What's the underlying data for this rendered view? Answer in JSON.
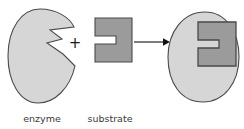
{
  "figure": {
    "background_color": "#ffffff"
  },
  "colors": {
    "enzyme_fill": "#d6d6d6",
    "enzyme_stroke": "#4a4a4a",
    "substrate_fill": "#9b9b9b",
    "substrate_stroke": "#4a4a4a",
    "arrow_color": "#111111",
    "plus_color": "#1a1a1a",
    "label_color": "#3a3a3a"
  },
  "labels": {
    "enzyme": "enzyme",
    "substrate": "substrate"
  },
  "operators": {
    "plus": "+",
    "arrow": "→"
  },
  "shapes": {
    "enzyme_blob": {
      "name": "enzyme",
      "description": "rounded blob with wedge-shaped active-site notch on right side",
      "path": "M 40,9 C 57,9 70,18 74,27 L 50,30 L 62,39 L 47,43 L 63,54 L 75,66 C 70,88 55,103 38,103 C 20,103 8,82 8,56 C 8,28 22,9 40,9 Z"
    },
    "substrate_free": {
      "name": "substrate",
      "description": "dark gray bracket / C shape that fits the enzyme notch",
      "path": "M 95,18 L 132,18 L 132,62 L 95,62 L 95,44 L 116,44 L 116,36 L 95,36 Z"
    },
    "enzyme_complex_blob": {
      "name": "enzyme-substrate-complex-enzyme",
      "description": "oval enzyme body after substrate binding",
      "path": "M 205,12 C 226,12 239,32 239,57 C 239,83 224,102 203,102 C 181,102 168,83 168,57 C 168,32 183,12 205,12 Z"
    },
    "substrate_bound": {
      "name": "bound-substrate",
      "description": "substrate seated in enzyme active site",
      "path": "M 198,22 L 236,22 L 236,66 L 198,66 L 198,48 L 219,48 L 219,40 L 198,40 Z"
    },
    "plus_sign": {
      "cx": 75,
      "cy": 42
    },
    "arrow": {
      "x1": 134,
      "y1": 42,
      "x2": 166,
      "y2": 42
    }
  },
  "label_positions": {
    "enzyme": {
      "x": 42,
      "y": 122
    },
    "substrate": {
      "x": 110,
      "y": 122
    }
  }
}
